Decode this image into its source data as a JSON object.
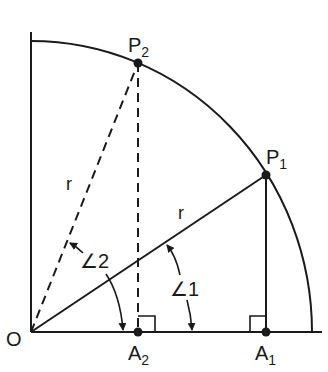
{
  "diagram": {
    "colors": {
      "stroke": "#1a1a1a",
      "background": "#ffffff"
    },
    "labels": {
      "origin": "O",
      "p1": "P",
      "p1_sub": "1",
      "p2": "P",
      "p2_sub": "2",
      "a1": "A",
      "a1_sub": "1",
      "a2": "A",
      "a2_sub": "2",
      "radius_solid": "r",
      "radius_dashed": "r",
      "angle1": "∠1",
      "angle2": "∠2"
    },
    "points": {
      "O": [
        31,
        332
      ],
      "P1": [
        266,
        175
      ],
      "P2": [
        138,
        63
      ],
      "A1": [
        266,
        332
      ],
      "A2": [
        138,
        332
      ]
    }
  }
}
